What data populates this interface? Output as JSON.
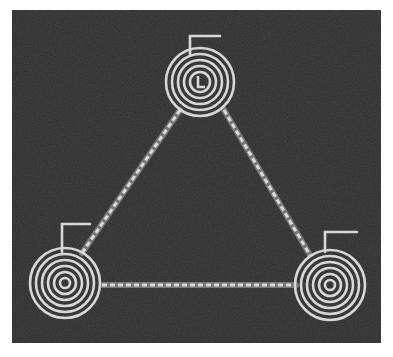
{
  "image": {
    "subject": "Twisted silver wire triangle with three spiral coils at the corners",
    "background_color": "#2b2b2b",
    "wire_color": "#d8d8d8"
  },
  "spirals": [
    {
      "name": "top",
      "cx": 188,
      "cy": 72,
      "r": 35
    },
    {
      "name": "bottom-left",
      "cx": 53,
      "cy": 273,
      "r": 36
    },
    {
      "name": "bottom-right",
      "cx": 318,
      "cy": 275,
      "r": 36
    }
  ]
}
